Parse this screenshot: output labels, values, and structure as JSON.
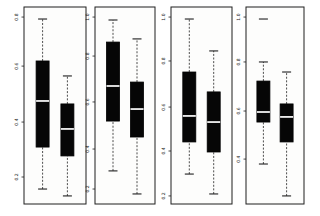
{
  "figure": {
    "background": "#ffffff",
    "panel_fill": "#fdfdfc",
    "frame_color": "#1f1f1f",
    "box_fill": "#060606",
    "box_stroke": "#000000",
    "median_color": "#ffffff",
    "whisker_color": "#3a3a3a",
    "tick_label_color": "#1a1a1a"
  },
  "chart_data": {
    "type": "boxplot",
    "orientation": "vertical",
    "title": "",
    "xlabel": "",
    "ylabel": "",
    "grid": "off",
    "legend": "none",
    "panel_count": 4,
    "groups_per_panel": 2,
    "value_units": "normalized fraction of panel axis height (0 = bottom frame, 1 = top frame); source tick labels rotated 90 deg and near-illegible",
    "panels": [
      {
        "name": "panel-1",
        "y_ticks": [
          {
            "label": "0.8",
            "pos": 0.949
          },
          {
            "label": "0.6",
            "pos": 0.7
          },
          {
            "label": "0.4",
            "pos": 0.416
          },
          {
            "label": "0.2",
            "pos": 0.137
          }
        ],
        "groups": [
          {
            "whisker_low": 0.076,
            "q1": 0.289,
            "median": 0.523,
            "q3": 0.726,
            "whisker_high": 0.939,
            "outliers": []
          },
          {
            "whisker_low": 0.041,
            "q1": 0.244,
            "median": 0.381,
            "q3": 0.508,
            "whisker_high": 0.65,
            "outliers": []
          }
        ]
      },
      {
        "name": "panel-2",
        "y_ticks": [
          {
            "label": "1.0",
            "pos": 0.949
          },
          {
            "label": "0.8",
            "pos": 0.751
          },
          {
            "label": "0.6",
            "pos": 0.518
          },
          {
            "label": "0.4",
            "pos": 0.279
          },
          {
            "label": "0.2",
            "pos": 0.076
          }
        ],
        "groups": [
          {
            "whisker_low": 0.168,
            "q1": 0.421,
            "median": 0.599,
            "q3": 0.822,
            "whisker_high": 0.934,
            "outliers": []
          },
          {
            "whisker_low": 0.051,
            "q1": 0.34,
            "median": 0.482,
            "q3": 0.619,
            "whisker_high": 0.838,
            "outliers": []
          }
        ]
      },
      {
        "name": "panel-3",
        "y_ticks": [
          {
            "label": "1.0",
            "pos": 0.949
          },
          {
            "label": "0.8",
            "pos": 0.726
          },
          {
            "label": "0.6",
            "pos": 0.492
          },
          {
            "label": "0.4",
            "pos": 0.269
          },
          {
            "label": "0.2",
            "pos": 0.041
          }
        ],
        "groups": [
          {
            "whisker_low": 0.152,
            "q1": 0.315,
            "median": 0.447,
            "q3": 0.67,
            "whisker_high": 0.939,
            "outliers": []
          },
          {
            "whisker_low": 0.051,
            "q1": 0.264,
            "median": 0.416,
            "q3": 0.569,
            "whisker_high": 0.777,
            "outliers": []
          }
        ]
      },
      {
        "name": "panel-4",
        "y_ticks": [
          {
            "label": "1.0",
            "pos": 0.949
          },
          {
            "label": "0.8",
            "pos": 0.721
          },
          {
            "label": "0.6",
            "pos": 0.472
          },
          {
            "label": "0.4",
            "pos": 0.228
          }
        ],
        "groups": [
          {
            "whisker_low": 0.203,
            "q1": 0.416,
            "median": 0.467,
            "q3": 0.624,
            "whisker_high": 0.721,
            "outliers": [
              0.939
            ]
          },
          {
            "whisker_low": 0.041,
            "q1": 0.315,
            "median": 0.442,
            "q3": 0.508,
            "whisker_high": 0.67,
            "outliers": []
          }
        ]
      }
    ]
  }
}
